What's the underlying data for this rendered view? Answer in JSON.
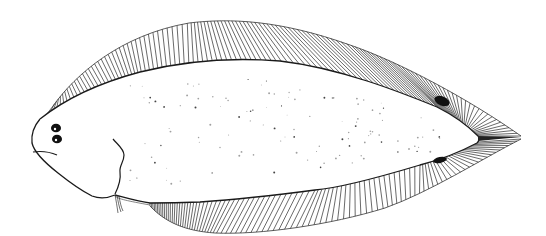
{
  "figure": {
    "caption": "Flatfish illustration",
    "colors": {
      "background": "#ffffff",
      "outline": "#1a1a1a",
      "fin_rays": "#2a2a2a",
      "speckle": "#9a9a9a",
      "spot": "#111111"
    },
    "features": {
      "eyes": 2,
      "dark_fin_spots": 2,
      "dorsal_fin": "continuous, many rays",
      "anal_fin": "continuous, many rays",
      "caudal": "pointed, confluent with dorsal and anal fins",
      "pelvic_fin": "small, below operculum"
    }
  }
}
